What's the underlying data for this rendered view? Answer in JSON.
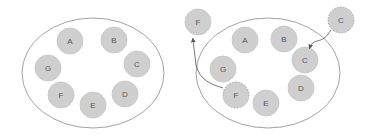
{
  "colors": {
    "node_fill": "#cfcfcf",
    "node_stroke": "#c4c4c4",
    "dashed_stroke": "#9a9a9a",
    "ellipse_stroke": "#8a8a8a",
    "arrow": "#555555",
    "label": "#555555"
  },
  "diagrams": [
    {
      "name": "before",
      "ellipse": {
        "cx": 93,
        "cy": 73,
        "rx": 71,
        "ry": 55
      },
      "nodes": [
        {
          "id": "A",
          "label": "A",
          "x": 70,
          "y": 41,
          "style": "solid"
        },
        {
          "id": "B",
          "label": "B",
          "x": 114,
          "y": 40,
          "style": "solid"
        },
        {
          "id": "C",
          "label": "C",
          "x": 137,
          "y": 64,
          "style": "solid"
        },
        {
          "id": "D",
          "label": "D",
          "x": 125,
          "y": 94,
          "style": "solid"
        },
        {
          "id": "E",
          "label": "E",
          "x": 93,
          "y": 105,
          "style": "solid"
        },
        {
          "id": "F",
          "label": "F",
          "x": 61,
          "y": 95,
          "style": "solid"
        },
        {
          "id": "G",
          "label": "G",
          "x": 48,
          "y": 68,
          "style": "solid"
        }
      ]
    },
    {
      "name": "after",
      "ellipse": {
        "cx": 268,
        "cy": 73,
        "rx": 72,
        "ry": 55
      },
      "nodes": [
        {
          "id": "F-out",
          "label": "F",
          "x": 198,
          "y": 22,
          "style": "solid"
        },
        {
          "id": "A",
          "label": "A",
          "x": 245,
          "y": 40,
          "style": "solid"
        },
        {
          "id": "B",
          "label": "B",
          "x": 284,
          "y": 39,
          "style": "solid"
        },
        {
          "id": "C",
          "label": "C",
          "x": 305,
          "y": 60,
          "style": "solid"
        },
        {
          "id": "C-out",
          "label": "C",
          "x": 341,
          "y": 20,
          "style": "dashed"
        },
        {
          "id": "G",
          "label": "G",
          "x": 223,
          "y": 69,
          "style": "solid"
        },
        {
          "id": "F",
          "label": "F",
          "x": 236,
          "y": 95,
          "style": "dashed"
        },
        {
          "id": "E",
          "label": "E",
          "x": 266,
          "y": 103,
          "style": "solid"
        },
        {
          "id": "D",
          "label": "D",
          "x": 301,
          "y": 88,
          "style": "solid"
        }
      ],
      "arrows": [
        {
          "name": "f-move-arrow",
          "from": "F",
          "to": "F-out"
        },
        {
          "name": "c-move-arrow",
          "from": "C-out",
          "to": "C"
        }
      ]
    }
  ]
}
